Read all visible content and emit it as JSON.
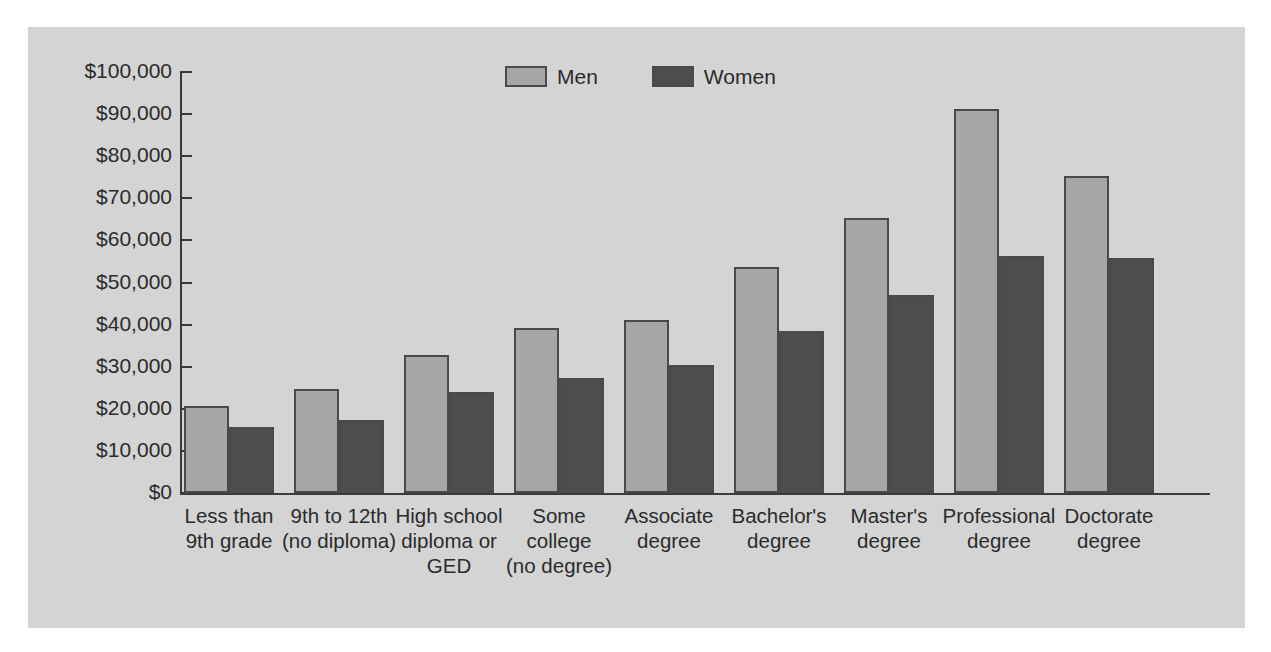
{
  "chart_data": {
    "type": "bar",
    "title": "",
    "subtitle": "",
    "xlabel": "",
    "ylabel": "",
    "ylim": [
      0,
      100000
    ],
    "ytick_values": [
      0,
      10000,
      20000,
      30000,
      40000,
      50000,
      60000,
      70000,
      80000,
      90000,
      100000
    ],
    "ytick_labels": [
      "$0",
      "$10,000",
      "$20,000",
      "$30,000",
      "$40,000",
      "$50,000",
      "$60,000",
      "$70,000",
      "$80,000",
      "$90,000",
      "$100,000"
    ],
    "grid": false,
    "legend_position": "top-center",
    "categories": [
      "Less than\n9th grade",
      "9th to 12th\n(no diploma)",
      "High school\ndiploma or\nGED",
      "Some\ncollege\n(no degree)",
      "Associate\ndegree",
      "Bachelor's\ndegree",
      "Master's\ndegree",
      "Professional\ndegree",
      "Doctorate\ndegree"
    ],
    "series": [
      {
        "name": "Men",
        "color": "#a6a6a6",
        "values": [
          20700,
          24700,
          32800,
          39200,
          41100,
          53700,
          65300,
          91200,
          75400
        ]
      },
      {
        "name": "Women",
        "color": "#4d4d4d",
        "values": [
          15600,
          17400,
          23900,
          27400,
          30300,
          38400,
          47000,
          56400,
          55800
        ]
      }
    ]
  },
  "legend": {
    "entries": [
      {
        "label": "Men"
      },
      {
        "label": "Women"
      }
    ]
  },
  "colors": {
    "men": "#a6a6a6",
    "women": "#4d4d4d",
    "panel": "#d4d4d4",
    "axis": "#3a3a3a",
    "text": "#2b2b2b",
    "background": "#ffffff"
  }
}
